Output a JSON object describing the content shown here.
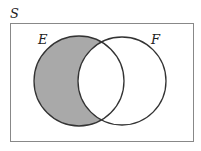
{
  "diagram": {
    "type": "venn",
    "universe_label": "S",
    "sets": [
      {
        "label": "E",
        "shaded": "only (E minus F)"
      },
      {
        "label": "F",
        "shaded": "none"
      }
    ],
    "shaded_region": "E ∩ Fᶜ",
    "colors": {
      "shade": "#a9a9a9",
      "stroke": "#333333",
      "border": "#888888",
      "background": "#ffffff"
    }
  }
}
